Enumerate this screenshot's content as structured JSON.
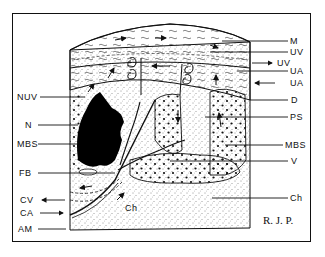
{
  "diagram": {
    "type": "anatomical schematic (placenta cross-section)",
    "signature": "R. J. P.",
    "labels_left": [
      {
        "id": "NUV",
        "text": "NUV"
      },
      {
        "id": "N",
        "text": "N"
      },
      {
        "id": "MBS",
        "text": "MBS"
      },
      {
        "id": "FB",
        "text": "FB"
      },
      {
        "id": "CV",
        "text": "CV"
      },
      {
        "id": "CA",
        "text": "CA"
      },
      {
        "id": "AM",
        "text": "AM"
      }
    ],
    "labels_right": [
      {
        "id": "M",
        "text": "M"
      },
      {
        "id": "UV1",
        "text": "UV"
      },
      {
        "id": "UV2",
        "text": "UV"
      },
      {
        "id": "UA1",
        "text": "UA"
      },
      {
        "id": "UA2",
        "text": "UA"
      },
      {
        "id": "D",
        "text": "D"
      },
      {
        "id": "PS",
        "text": "PS"
      },
      {
        "id": "MBS",
        "text": "MBS"
      },
      {
        "id": "V",
        "text": "V"
      },
      {
        "id": "Ch",
        "text": "Ch"
      }
    ],
    "inner_labels": [
      {
        "id": "Ch_inner",
        "text": "Ch"
      }
    ],
    "colors": {
      "ink": "#111111",
      "paper": "#ffffff"
    }
  }
}
